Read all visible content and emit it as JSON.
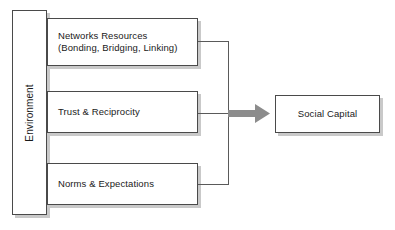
{
  "diagram": {
    "context_box": {
      "label": "Environment",
      "orientation": "vertical-rotated"
    },
    "drivers": [
      {
        "label": "Networks Resources\n(Bonding, Bridging, Linking)"
      },
      {
        "label": "Trust & Reciprocity"
      },
      {
        "label": "Norms & Expectations"
      }
    ],
    "outcome": {
      "label": "Social Capital"
    },
    "connector": {
      "arrow_icon": "right-arrow-icon",
      "arrow_color": "#8c8c8c",
      "line_color": "#5a5a5a"
    },
    "style": {
      "box_fill": "#ffffff",
      "box_border": "#4a4a4a",
      "box_shadow": "#c9c9c9",
      "text_color": "#1a1a1a",
      "background": "#ffffff"
    }
  }
}
